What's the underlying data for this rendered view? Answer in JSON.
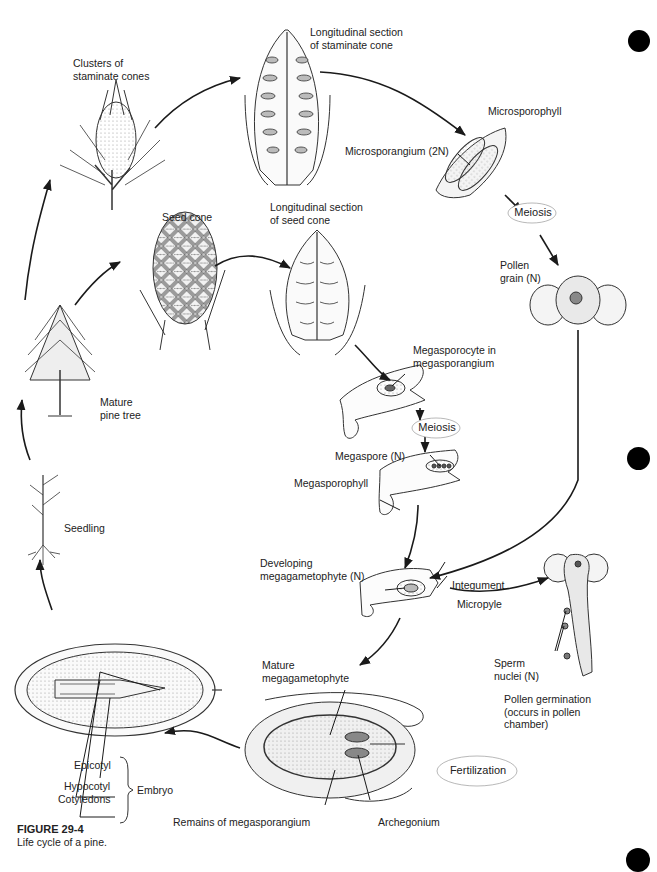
{
  "page": {
    "page_number_faint": "",
    "figure": {
      "number": "FIGURE 29-4",
      "caption": "Life cycle of a pine."
    }
  },
  "stages": {
    "staminate_clusters": "Clusters of\nstaminate cones",
    "staminate_section": "Longitudinal section\nof staminate cone",
    "microsporophyll": "Microsporophyll",
    "microsporangium": "Microsporangium (2N)",
    "meiosis_1": "Meiosis",
    "pollen_grain": "Pollen\ngrain (N)",
    "seed_cone": "Seed cone",
    "seed_section": "Longitudinal section\nof seed cone",
    "megasporocyte": "Megasporocyte in\nmegasporangium",
    "meiosis_2": "Meiosis",
    "megaspore": "Megaspore (N)",
    "megasporophyll": "Megasporophyll",
    "mature_tree": "Mature\npine tree",
    "seedling": "Seedling",
    "developing_megagametophyte": "Developing\nmegagametophyte (N)",
    "integument": "Integument",
    "micropyle": "Micropyle",
    "sperm_nuclei": "Sperm\nnuclei (N)",
    "pollen_germination": "Pollen germination\n(occurs in pollen\nchamber)",
    "mature_megagametophyte": "Mature\nmegagametophyte",
    "fertilization": "Fertilization",
    "remains_megasporangium": "Remains of megasporangium",
    "archegonium": "Archegonium",
    "epicotyl": "Epicotyl",
    "hypocotyl": "Hypocotyl",
    "cotyledons": "Cotyledons",
    "embryo": "Embryo"
  },
  "colors": {
    "ink": "#1a1a1a",
    "stipple": "#cfcfcf",
    "registration_mark": "#000000"
  }
}
